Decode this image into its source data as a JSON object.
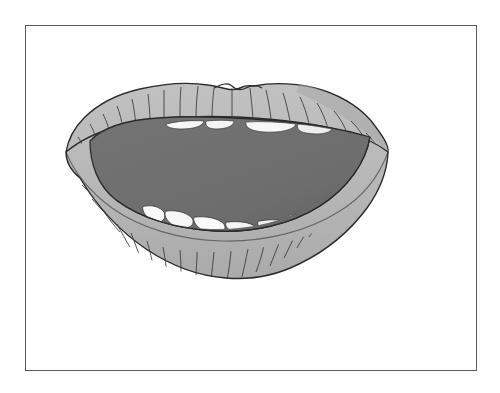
{
  "image": {
    "title": "Open mouth illustration",
    "subject": "mouth",
    "style": "grayscale clip-art line drawing",
    "background_color": "#ffffff"
  },
  "frame": {
    "name": "picture-frame-border",
    "x": 25,
    "y": 25,
    "width": 452,
    "height": 346,
    "stroke_color": "#5a5a5a",
    "stroke_width": 1,
    "fill_color": "#ffffff"
  },
  "palette": {
    "lip_fill": "#b6b6b6",
    "lip_fill_light": "#c3c3c3",
    "lip_shadow": "#9e9e9e",
    "inner_mouth": "#6e6e6e",
    "inner_mouth_shadow": "#636363",
    "tooth_fill": "#f7f7f7",
    "tooth_shadow": "#d8d8d8",
    "outline": "#2b2b2b",
    "crease_line": "#3a3a3a"
  },
  "parts": [
    {
      "id": "upper-lip",
      "label": "Upper lip",
      "description": "Light gray upper lip with cupid's bow notch at top center and radial crease lines",
      "crease_count": 18
    },
    {
      "id": "lower-lip",
      "label": "Lower lip",
      "description": "Light gray lower lip with vertical crease lines curving downward",
      "crease_count": 20
    },
    {
      "id": "oral-cavity",
      "label": "Inner mouth",
      "description": "Dark gray open mouth interior",
      "fill": "#6e6e6e"
    },
    {
      "id": "upper-teeth",
      "label": "Upper teeth",
      "description": "Thin white slivers of upper teeth visible along the top edge of the oral cavity",
      "count": 4
    },
    {
      "id": "lower-teeth",
      "label": "Lower teeth",
      "description": "Rounded white lower teeth along the bottom edge of the oral cavity",
      "count": 6
    }
  ],
  "geometry": {
    "mouth_left_x": 66,
    "mouth_right_x": 388,
    "mouth_top_y": 86,
    "mouth_bottom_y": 277,
    "cavity_left_x": 88,
    "cavity_right_x": 370,
    "cavity_top_y": 122,
    "cavity_bottom_y": 228
  }
}
